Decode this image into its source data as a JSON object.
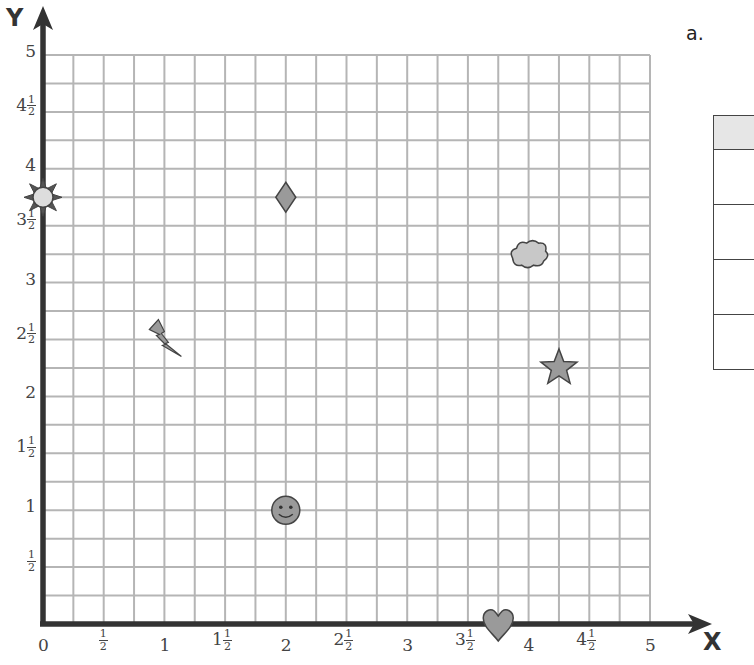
{
  "part_label": "a.",
  "axes": {
    "x_name": "X",
    "y_name": "Y"
  },
  "chart_data": {
    "type": "scatter",
    "title": "",
    "xlabel": "X",
    "ylabel": "Y",
    "xlim": [
      0,
      5
    ],
    "ylim": [
      0,
      5
    ],
    "grid": true,
    "grid_step": 0.25,
    "x_ticks": [
      "0",
      "1/2",
      "1",
      "1 1/2",
      "2",
      "2 1/2",
      "3",
      "3 1/2",
      "4",
      "4 1/2",
      "5"
    ],
    "y_ticks": [
      "1/2",
      "1",
      "1 1/2",
      "2",
      "2 1/2",
      "3",
      "3 1/2",
      "4",
      "4 1/2",
      "5"
    ],
    "points": [
      {
        "name": "sun",
        "x": 0,
        "y": 3.75
      },
      {
        "name": "diamond",
        "x": 2,
        "y": 3.75
      },
      {
        "name": "cloud",
        "x": 4,
        "y": 3.25
      },
      {
        "name": "lightning",
        "x": 1,
        "y": 2.5
      },
      {
        "name": "star",
        "x": 4.25,
        "y": 2.25
      },
      {
        "name": "smiley",
        "x": 2,
        "y": 1
      },
      {
        "name": "heart",
        "x": 3.75,
        "y": 0
      }
    ]
  },
  "x_tick_labels": [
    {
      "whole": "0",
      "frac": false
    },
    {
      "whole": "",
      "frac": true
    },
    {
      "whole": "1",
      "frac": false
    },
    {
      "whole": "1",
      "frac": true
    },
    {
      "whole": "2",
      "frac": false
    },
    {
      "whole": "2",
      "frac": true
    },
    {
      "whole": "3",
      "frac": false
    },
    {
      "whole": "3",
      "frac": true
    },
    {
      "whole": "4",
      "frac": false
    },
    {
      "whole": "4",
      "frac": true
    },
    {
      "whole": "5",
      "frac": false
    }
  ],
  "y_tick_labels": [
    {
      "value": 0.5,
      "whole": "",
      "frac": true
    },
    {
      "value": 1,
      "whole": "1",
      "frac": false
    },
    {
      "value": 1.5,
      "whole": "1",
      "frac": true
    },
    {
      "value": 2,
      "whole": "2",
      "frac": false
    },
    {
      "value": 2.5,
      "whole": "2",
      "frac": true
    },
    {
      "value": 3,
      "whole": "3",
      "frac": false
    },
    {
      "value": 3.5,
      "whole": "3",
      "frac": true
    },
    {
      "value": 4,
      "whole": "4",
      "frac": false
    },
    {
      "value": 4.5,
      "whole": "4",
      "frac": true
    },
    {
      "value": 5,
      "whole": "5",
      "frac": false
    }
  ],
  "fraction": {
    "num": "1",
    "den": "2"
  },
  "table": {
    "rows": 4,
    "header_color": "#e6e6e6"
  },
  "colors": {
    "grid": "#b5b5b5",
    "axis": "#333333",
    "shape_fill": "#9a9a9a",
    "shape_stroke": "#444444",
    "sun_fill": "#dddddd",
    "cloud_fill": "#c8c8c8"
  }
}
